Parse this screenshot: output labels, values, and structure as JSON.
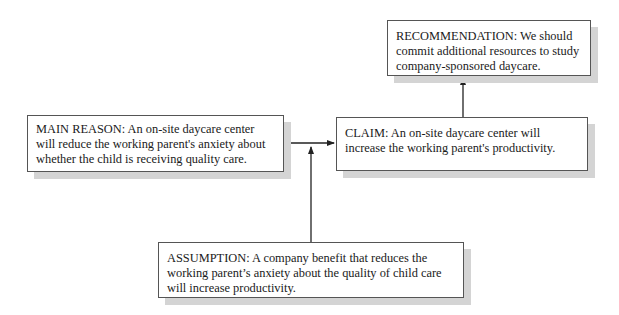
{
  "diagram": {
    "nodes": {
      "recommendation": {
        "label": "RECOMMENDATION",
        "text": "RECOMMENDATION: We should commit additional resources to study company-sponsored daycare."
      },
      "main_reason": {
        "label": "MAIN REASON",
        "text": "MAIN REASON: An on-site daycare center will reduce the working parent's anxiety about whether the child is receiving quality care."
      },
      "claim": {
        "label": "CLAIM",
        "text": "CLAIM: An on-site daycare center will increase the working parent's productivity."
      },
      "assumption": {
        "label": "ASSUMPTION",
        "text": "ASSUMPTION: A company benefit that reduces the working parent’s anxiety about the quality of child care will increase productivity."
      }
    },
    "edges": [
      {
        "from": "main_reason",
        "to": "claim"
      },
      {
        "from": "assumption",
        "to": "main_reason-claim link"
      },
      {
        "from": "claim",
        "to": "recommendation"
      }
    ],
    "colors": {
      "border": "#555555",
      "shadow": "#d4d4d4",
      "arrow": "#222222"
    }
  }
}
